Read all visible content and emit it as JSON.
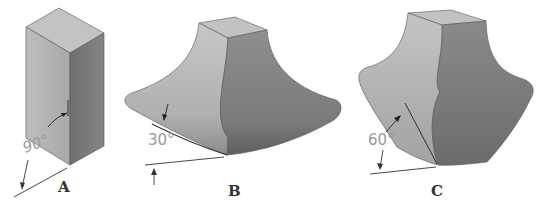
{
  "figures": [
    {
      "id": "A",
      "label": "A",
      "shape": "rectangular-prism",
      "angle_label": "90°"
    },
    {
      "id": "B",
      "label": "B",
      "shape": "flared-base-solid",
      "angle_label": "30°"
    },
    {
      "id": "C",
      "label": "C",
      "shape": "bulged-solid",
      "angle_label": "60°"
    }
  ],
  "colors": {
    "background": "#ffffff",
    "face_light": "#b4b4b4",
    "face_top": "#c2c2c2",
    "face_dark": "#7e7e7e",
    "line": "#333333",
    "dimension_text": "#9a9a9a"
  }
}
